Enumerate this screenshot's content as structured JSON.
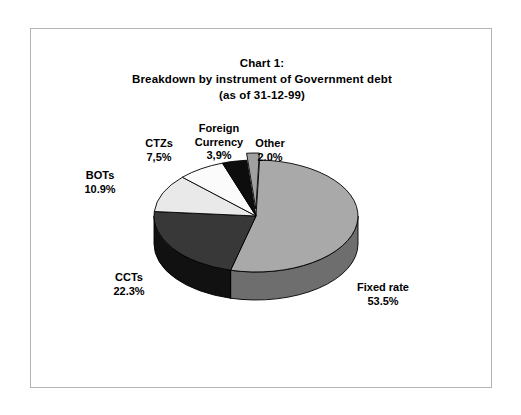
{
  "chart_data": {
    "type": "pie",
    "title": "Chart 1:",
    "subtitle": "Breakdown by instrument of Government debt",
    "subtitle2": "(as of 31-12-99)",
    "title_lines": [
      "Chart 1:",
      "Breakdown by instrument of Government debt",
      "(as of 31-12-99)"
    ],
    "categories": [
      "Fixed rate",
      "CCTs",
      "BOTs",
      "CTZs",
      "Foreign Currency",
      "Other"
    ],
    "values": [
      53.5,
      22.3,
      10.9,
      7.5,
      3.9,
      2.0
    ],
    "value_labels": [
      "53.5%",
      "22.3%",
      "10.9%",
      "7,5%",
      "3,9%",
      "2.0%"
    ],
    "colors": [
      "#a9a9a9",
      "#383838",
      "#e9e9e9",
      "#fbfbfb",
      "#0d0d0d",
      "#a0a0a0"
    ],
    "side_colors": [
      "#6e6e6e",
      "#111111",
      "#9a9a9a",
      "#bdbdbd",
      "#000000",
      "#6a6a6a"
    ],
    "xlabel": "",
    "ylabel": "",
    "legend": "none",
    "grid": false,
    "three_d": true,
    "exploded_slice": "Other"
  },
  "labels": {
    "fixed_rate": {
      "name": "Fixed rate",
      "value": "53.5%"
    },
    "ccts": {
      "name": "CCTs",
      "value": "22.3%"
    },
    "bots": {
      "name": "BOTs",
      "value": "10.9%"
    },
    "ctzs": {
      "name": "CTZs",
      "value": "7,5%"
    },
    "foreign_currency": {
      "name": "Foreign",
      "name2": "Currency",
      "value": "3,9%"
    },
    "other": {
      "name": "Other",
      "value": "2.0%"
    }
  }
}
